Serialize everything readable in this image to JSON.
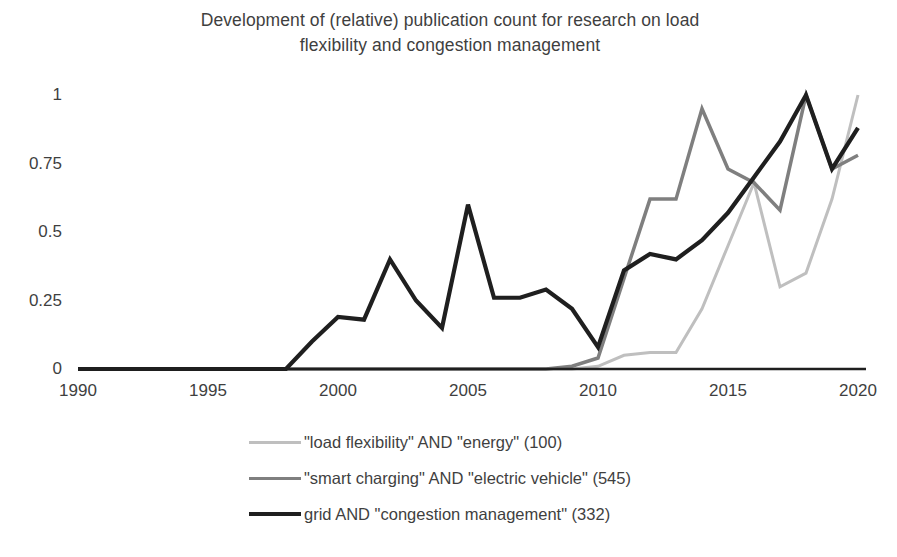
{
  "chart_data": {
    "type": "line",
    "title": "Development of (relative) publication count for research on load flexibility and congestion management",
    "title_line1": "Development of (relative) publication count for research on load",
    "title_line2": "flexibility and congestion management",
    "xlabel": "",
    "ylabel": "",
    "xlim": [
      1990,
      2020
    ],
    "ylim": [
      0,
      1
    ],
    "grid": false,
    "legend_position": "bottom",
    "x_tick_labels": [
      "1990",
      "1995",
      "2000",
      "2005",
      "2010",
      "2015",
      "2020"
    ],
    "x_ticks": [
      1990,
      1995,
      2000,
      2005,
      2010,
      2015,
      2020
    ],
    "y_tick_labels": [
      "0",
      "0.25",
      "0.5",
      "0.75",
      "1"
    ],
    "y_ticks": [
      0,
      0.25,
      0.5,
      0.75,
      1
    ],
    "x": [
      1990,
      1991,
      1992,
      1993,
      1994,
      1995,
      1996,
      1997,
      1998,
      1999,
      2000,
      2001,
      2002,
      2003,
      2004,
      2005,
      2006,
      2007,
      2008,
      2009,
      2010,
      2011,
      2012,
      2013,
      2014,
      2015,
      2016,
      2017,
      2018,
      2019,
      2020
    ],
    "series": [
      {
        "name": "\"load flexibility\" AND \"energy\" (100)",
        "color": "#bfbfbf",
        "width": 3,
        "values": [
          0,
          0,
          0,
          0,
          0,
          0,
          0,
          0,
          0,
          0,
          0,
          0,
          0,
          0,
          0,
          0,
          0,
          0,
          0,
          0,
          0.01,
          0.05,
          0.06,
          0.06,
          0.22,
          0.45,
          0.68,
          0.3,
          0.35,
          0.62,
          1.0
        ]
      },
      {
        "name": "\"smart charging\" AND \"electric vehicle\" (545)",
        "color": "#7f7f7f",
        "width": 3.5,
        "values": [
          0,
          0,
          0,
          0,
          0,
          0,
          0,
          0,
          0,
          0,
          0,
          0,
          0,
          0,
          0,
          0,
          0,
          0,
          0,
          0.01,
          0.04,
          0.33,
          0.62,
          0.62,
          0.95,
          0.73,
          0.68,
          0.58,
          1.0,
          0.73,
          0.78
        ]
      },
      {
        "name": "grid AND \"congestion management\" (332)",
        "color": "#1f1f1f",
        "width": 4.2,
        "values": [
          0,
          0,
          0,
          0,
          0,
          0,
          0,
          0,
          0,
          0.1,
          0.19,
          0.18,
          0.4,
          0.25,
          0.15,
          0.6,
          0.26,
          0.26,
          0.29,
          0.22,
          0.08,
          0.36,
          0.42,
          0.4,
          0.47,
          0.57,
          0.7,
          0.83,
          1.0,
          0.73,
          0.88
        ]
      }
    ]
  },
  "legend": {
    "items": [
      {
        "label": "\"load flexibility\" AND \"energy\" (100)"
      },
      {
        "label": "\"smart charging\" AND \"electric vehicle\" (545)"
      },
      {
        "label": "grid AND \"congestion management\" (332)"
      }
    ]
  },
  "colors": {
    "series_light": "#bfbfbf",
    "series_medium": "#7f7f7f",
    "series_dark": "#1f1f1f",
    "axis": "#1f1f1f",
    "text": "#3f3f3f",
    "background": "#ffffff"
  }
}
